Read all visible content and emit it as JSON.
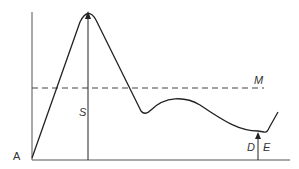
{
  "diagram": {
    "labels": {
      "origin": "A",
      "peak_arrow": "S",
      "reference_line": "M",
      "dip_arrow_left": "D",
      "dip_arrow_right": "E"
    },
    "colors": {
      "line": "#222222",
      "dashed": "#444444",
      "axis": "#555555",
      "text": "#333333"
    },
    "geometry": {
      "y_axis": {
        "x": 32,
        "y_top": 12,
        "y_bottom": 160
      },
      "x_axis": {
        "y": 160,
        "x_left": 32,
        "x_right": 290
      },
      "reference_line_y": 88,
      "peak": {
        "x": 88,
        "y": 12
      },
      "dip": {
        "x": 258,
        "y": 132
      }
    }
  }
}
